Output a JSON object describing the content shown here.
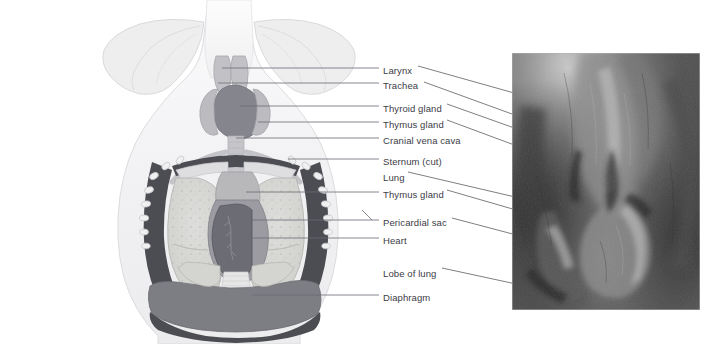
{
  "figure": {
    "background_color": "#ffffff",
    "width": 717,
    "height": 344
  },
  "labels": [
    {
      "id": "larynx",
      "text": "Larynx",
      "x": 383,
      "y": 66,
      "left_leader": true,
      "right_leader": true
    },
    {
      "id": "trachea",
      "text": "Trachea",
      "x": 383,
      "y": 81,
      "left_leader": true,
      "right_leader": true
    },
    {
      "id": "thyroid-gland",
      "text": "Thyroid gland",
      "x": 383,
      "y": 104,
      "left_leader": true,
      "right_leader": true
    },
    {
      "id": "thymus-gland-1",
      "text": "Thymus gland",
      "x": 383,
      "y": 120,
      "left_leader": true,
      "right_leader": true
    },
    {
      "id": "cranial-vena-cava",
      "text": "Cranial vena cava",
      "x": 383,
      "y": 136,
      "left_leader": true,
      "right_leader": false
    },
    {
      "id": "sternum-cut",
      "text": "Sternum (cut)",
      "x": 383,
      "y": 157,
      "left_leader": true,
      "right_leader": false
    },
    {
      "id": "lung",
      "text": "Lung",
      "x": 383,
      "y": 173,
      "left_leader": false,
      "right_leader": true
    },
    {
      "id": "thymus-gland-2",
      "text": "Thymus gland",
      "x": 383,
      "y": 190,
      "left_leader": true,
      "right_leader": true
    },
    {
      "id": "pericardial-sac",
      "text": "Pericardial sac",
      "x": 383,
      "y": 218,
      "left_leader": true,
      "right_leader": true
    },
    {
      "id": "heart",
      "text": "Heart",
      "x": 383,
      "y": 236,
      "left_leader": true,
      "right_leader": false
    },
    {
      "id": "lobe-of-lung",
      "text": "Lobe of lung",
      "x": 383,
      "y": 269,
      "left_leader": false,
      "right_leader": true
    },
    {
      "id": "diaphragm",
      "text": "Diaphragm",
      "x": 383,
      "y": 293,
      "left_leader": true,
      "right_leader": false
    }
  ],
  "diagram": {
    "name": "ventral-thorax-diagram",
    "colors": {
      "body_outline": "#d9d9dd",
      "body_fill": "#f2f2f4",
      "scapula": "#ececed",
      "chest_wall_dark": "#4f4f55",
      "diaphragm": "#7b7b82",
      "lung": "#d5d5d2",
      "heart": "#6e6e76",
      "pericardial_sac": "#9a9aa0",
      "thyroid": "#8b8b93",
      "thymus": "#b5b5b8",
      "trachea": "#b9b9bd",
      "ribs": "#e8e8e8"
    }
  },
  "photograph": {
    "name": "cadaver-dissection-photo",
    "description": "Grayscale photograph of a dissected thorax showing trachea, thymus, pericardial sac and lung lobes",
    "x": 512,
    "y": 53,
    "width": 188,
    "height": 257,
    "border_color": "#b4b4b4"
  },
  "leader_lines": {
    "color": "#6b6b74",
    "width": 0.8
  }
}
